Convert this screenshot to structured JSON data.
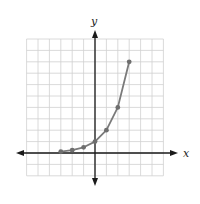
{
  "chart_data": {
    "type": "line",
    "title": "",
    "xlabel": "x",
    "ylabel": "y",
    "xlim": [
      -6,
      6
    ],
    "ylim": [
      -2,
      10
    ],
    "grid": true,
    "legend": null,
    "series": [
      {
        "name": "y = 2^x",
        "x": [
          -3,
          -2,
          -1,
          0,
          1,
          2,
          3
        ],
        "y": [
          0.125,
          0.25,
          0.5,
          1,
          2,
          4,
          8
        ],
        "markers": true
      }
    ]
  },
  "labels": {
    "x_axis": "x",
    "y_axis": "y"
  },
  "colors": {
    "grid": "#d0d0d0",
    "axis": "#1a1a1a",
    "curve": "#7a7a7a",
    "point": "#6e6e6e"
  }
}
